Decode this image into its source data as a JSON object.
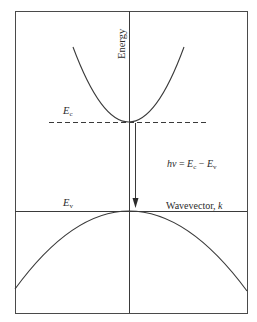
{
  "diagram": {
    "colors": {
      "stroke": "#3a3a3a",
      "text": "#2a2a2a",
      "background": "#ffffff"
    },
    "labels": {
      "energy_axis": "Energy",
      "conduction_band_edge": {
        "symbol": "E",
        "subscript": "c"
      },
      "valence_band_edge": {
        "symbol": "E",
        "subscript": "v"
      },
      "transition_equation": {
        "lhs": "hν",
        "eq": " = ",
        "term1": {
          "symbol": "E",
          "subscript": "c"
        },
        "minus": " − ",
        "term2": {
          "symbol": "E",
          "subscript": "v"
        }
      },
      "wavevector_axis": {
        "text": "Wavevector, ",
        "var": "k"
      }
    },
    "elements": {
      "frame": {
        "x": 15,
        "y": 11,
        "width": 232,
        "height": 302
      },
      "vertical_axis_x": 129,
      "conduction_band": {
        "shape": "parabola-up",
        "vertex": [
          129,
          122
        ],
        "left_end": [
          73,
          47
        ],
        "right_end": [
          184,
          47
        ]
      },
      "ec_dashed_line": {
        "y": 122,
        "x_start": 49,
        "x_end": 207
      },
      "valence_band": {
        "shape": "parabola-down",
        "vertex": [
          129,
          211
        ],
        "left_end": [
          15,
          289
        ],
        "right_end": [
          247,
          291
        ]
      },
      "ev_line": {
        "y": 211,
        "x_start": 15,
        "x_end": 247
      },
      "transition_arrow": {
        "x": 135,
        "y_start": 123,
        "y_end": 207,
        "direction": "down"
      }
    }
  }
}
